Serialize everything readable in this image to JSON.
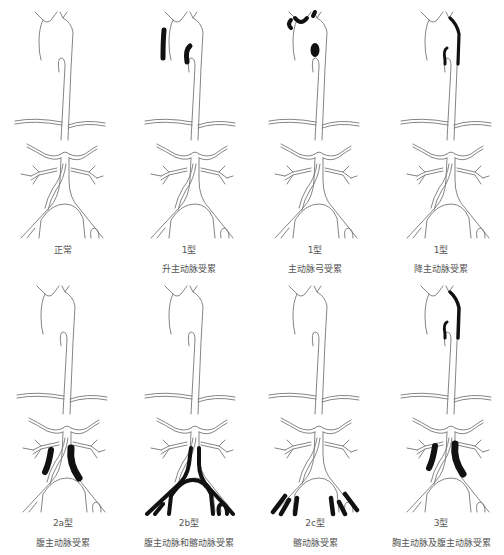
{
  "figure": {
    "title": "",
    "panels": [
      {
        "id": "normal",
        "type_label": "",
        "description": "正常",
        "row": 0,
        "col": 0,
        "affected": []
      },
      {
        "id": "type1-ascending",
        "type_label": "1型",
        "description": "升主动脉受累",
        "row": 0,
        "col": 1,
        "affected": [
          "ascending-aorta",
          "arch-branch-left"
        ]
      },
      {
        "id": "type1-arch",
        "type_label": "1型",
        "description": "主动脉弓受累",
        "row": 0,
        "col": 2,
        "affected": [
          "aortic-arch-branches",
          "arch-inner"
        ]
      },
      {
        "id": "type1-descending",
        "type_label": "1型",
        "description": "降主动脉受累",
        "row": 0,
        "col": 3,
        "affected": [
          "descending-thoracic-aorta"
        ]
      },
      {
        "id": "type2a",
        "type_label": "2a型",
        "description": "腹主动脉受累",
        "row": 1,
        "col": 0,
        "affected": [
          "abdominal-aorta"
        ]
      },
      {
        "id": "type2b",
        "type_label": "2b型",
        "description": "腹主动脉和髂动脉受累",
        "row": 1,
        "col": 1,
        "affected": [
          "abdominal-aorta",
          "iliac-arteries"
        ]
      },
      {
        "id": "type2c",
        "type_label": "2c型",
        "description": "髂动脉受累",
        "row": 1,
        "col": 2,
        "affected": [
          "distal-iliac-arteries"
        ]
      },
      {
        "id": "type3",
        "type_label": "3型",
        "description": "胸主动脉及腹主动脉受累",
        "row": 1,
        "col": 3,
        "affected": [
          "descending-thoracic-aorta",
          "abdominal-aorta"
        ]
      }
    ]
  },
  "colors": {
    "vessel_outline": "#777777",
    "lesion": "#111111",
    "label_text": "#555555",
    "background": "#ffffff"
  }
}
